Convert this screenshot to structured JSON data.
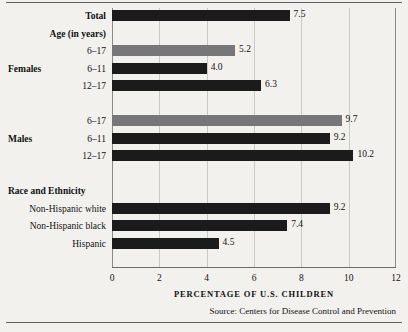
{
  "chart_data": {
    "type": "bar",
    "orientation": "horizontal",
    "title": "",
    "xlabel": "PERCENTAGE OF U.S. CHILDREN",
    "ylabel": "",
    "xlim": [
      0,
      12
    ],
    "xticks": [
      0,
      2,
      4,
      6,
      8,
      10,
      12
    ],
    "xtick_labels": [
      "0",
      "2",
      "4",
      "6",
      "8",
      "10",
      "12"
    ],
    "grid": "vertical",
    "legend": "none",
    "categories": [
      "Total",
      "6–17",
      "6–11",
      "12–17",
      "6–17",
      "6–11",
      "12–17",
      "Non-Hispanic white",
      "Non-Hispanic black",
      "Hispanic"
    ],
    "values": [
      7.5,
      5.2,
      4.0,
      6.3,
      9.7,
      9.2,
      10.2,
      9.2,
      7.4,
      4.5
    ],
    "value_labels": [
      "7.5",
      "5.2",
      "4.0",
      "6.3",
      "9.7",
      "9.2",
      "10.2",
      "9.2",
      "7.4",
      "4.5"
    ],
    "colors": {
      "dark_bar": "#1b1b1b",
      "gray_bar": "#77777a",
      "background": "#f2f1ee",
      "gridline": "#c9c9c6",
      "axis": "#6d6d70"
    },
    "section_headers": [
      "Age (in years)",
      "Race and Ethnicity"
    ],
    "group_labels": [
      "Females",
      "Males"
    ],
    "source": "Source:  Centers for Disease Control and Prevention"
  },
  "rows": [
    {
      "label": "Total",
      "label_bold": true,
      "value": 7.5,
      "value_label": "7.5",
      "style": "dark"
    },
    {
      "label": "6–17",
      "label_bold": false,
      "value": 5.2,
      "value_label": "5.2",
      "style": "gray"
    },
    {
      "label": "6–11",
      "label_bold": false,
      "value": 4.0,
      "value_label": "4.0",
      "style": "dark"
    },
    {
      "label": "12–17",
      "label_bold": false,
      "value": 6.3,
      "value_label": "6.3",
      "style": "dark"
    },
    {
      "label": "6–17",
      "label_bold": false,
      "value": 9.7,
      "value_label": "9.7",
      "style": "gray"
    },
    {
      "label": "6–11",
      "label_bold": false,
      "value": 9.2,
      "value_label": "9.2",
      "style": "dark"
    },
    {
      "label": "12–17",
      "label_bold": false,
      "value": 10.2,
      "value_label": "10.2",
      "style": "dark"
    },
    {
      "label": "Non-Hispanic white",
      "label_bold": false,
      "value": 9.2,
      "value_label": "9.2",
      "style": "dark"
    },
    {
      "label": "Non-Hispanic black",
      "label_bold": false,
      "value": 7.4,
      "value_label": "7.4",
      "style": "dark"
    },
    {
      "label": "Hispanic",
      "label_bold": false,
      "value": 4.5,
      "value_label": "4.5",
      "style": "dark"
    }
  ],
  "headers": {
    "age": "Age (in years)",
    "race": "Race and Ethnicity"
  },
  "groups": {
    "females": "Females",
    "males": "Males"
  },
  "axis": {
    "title": "PERCENTAGE OF U.S. CHILDREN",
    "ticks": [
      "0",
      "2",
      "4",
      "6",
      "8",
      "10",
      "12"
    ]
  },
  "footer": {
    "source": "Source:  Centers for Disease Control and Prevention"
  }
}
